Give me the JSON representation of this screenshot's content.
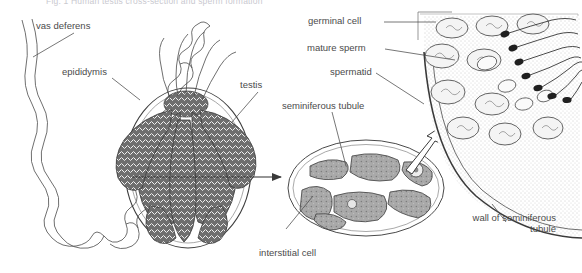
{
  "figure": {
    "caption": "Fig. 1  Human testis cross-section and sperm formation",
    "type": "biological-diagram",
    "background_color": "#ffffff",
    "ink_color": "#4a4a4a",
    "tissue_fill": "#a8a8a8"
  },
  "labels": {
    "vas_deferens": "vas deferens",
    "epididymis": "epididymis",
    "testis": "testis",
    "seminiferous_tubule": "seminiferous tubule",
    "interstitial_cell": "interstitial cell",
    "germinal_cell": "germinal cell",
    "mature_sperm": "mature sperm",
    "spermatid": "spermatid",
    "wall_of_seminiferous_tubule": "wall of seminiferous tubule"
  },
  "panels": [
    {
      "name": "whole-organ",
      "contents": [
        "vas deferens",
        "epididymis",
        "testis"
      ]
    },
    {
      "name": "tubule-cross-section",
      "contents": [
        "seminiferous tubule",
        "interstitial cell"
      ]
    },
    {
      "name": "tubule-wall-magnified",
      "contents": [
        "germinal cell",
        "spermatid",
        "mature sperm",
        "wall of seminiferous tubule"
      ]
    }
  ],
  "connectors": [
    {
      "name": "organ-to-cross-section",
      "style": "solid-arrow",
      "direction": "right"
    },
    {
      "name": "cross-section-to-wall-detail",
      "style": "hollow-arrow",
      "direction": "up-right"
    }
  ]
}
